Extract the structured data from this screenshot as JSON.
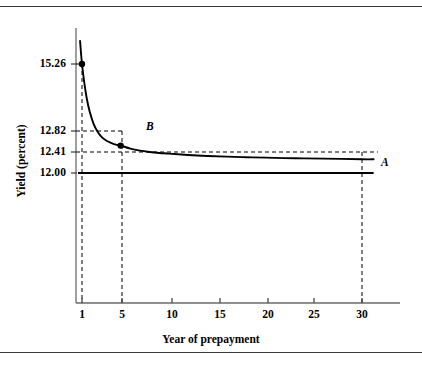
{
  "chart_data": {
    "type": "line",
    "title": "",
    "xlabel": "Year of prepayment",
    "ylabel": "Yield (percent)",
    "xlim": [
      0,
      31.5
    ],
    "ylim": [
      12.0,
      15.95
    ],
    "grid": false,
    "legend": "none",
    "x_ticks": [
      1,
      5,
      10,
      15,
      20,
      25,
      30
    ],
    "x_tick_labels": [
      "1",
      "5",
      "10",
      "15",
      "20",
      "25",
      "30"
    ],
    "y_ticks": [
      12.0,
      12.41,
      12.82,
      15.26
    ],
    "y_tick_labels": [
      "12.00",
      "12.41",
      "12.82",
      "15.26"
    ],
    "series": [
      {
        "name": "Yield to prepayment (curve)",
        "type": "line",
        "style": "solid",
        "x": [
          0.8,
          0.9,
          1.0,
          1.2,
          1.5,
          1.8,
          2.2,
          2.6,
          3.0,
          3.5,
          4.0,
          4.5,
          5.0,
          6.0,
          7.0,
          8.0,
          9.0,
          10.0,
          12.0,
          14.0,
          16.0,
          18.0,
          20.0,
          23.0,
          26.0,
          30.0,
          31.2
        ],
        "y": [
          15.95,
          15.58,
          15.26,
          14.78,
          14.22,
          13.83,
          13.47,
          13.24,
          13.09,
          12.97,
          12.9,
          12.85,
          12.82,
          12.73,
          12.67,
          12.63,
          12.6,
          12.58,
          12.54,
          12.51,
          12.49,
          12.47,
          12.46,
          12.44,
          12.43,
          12.41,
          12.41
        ]
      },
      {
        "name": "Yield to maturity (line A)",
        "type": "line",
        "style": "solid",
        "x": [
          1.0,
          31.2
        ],
        "y": [
          12.0,
          12.0
        ]
      },
      {
        "name": "Asymptote 12.41 (dashed)",
        "type": "line",
        "style": "dashed",
        "x": [
          1.0,
          31.2
        ],
        "y": [
          12.41,
          12.41
        ]
      }
    ],
    "points": [
      {
        "label": "",
        "x": 1,
        "y": 15.26
      },
      {
        "label": "B",
        "x": 5,
        "y": 12.82
      }
    ],
    "annotations": [
      {
        "label": "B",
        "x": 7.0,
        "y": 12.94
      },
      {
        "label": "A",
        "x": 31.0,
        "y": 11.92
      }
    ],
    "guides": [
      {
        "orientation": "horizontal",
        "value": 15.26,
        "style": "dashed",
        "from_x": 0,
        "to_x": 1
      },
      {
        "orientation": "horizontal",
        "value": 12.82,
        "style": "dashed",
        "from_x": 0,
        "to_x": 5
      },
      {
        "orientation": "horizontal",
        "value": 12.41,
        "style": "dashed",
        "from_x": 0,
        "to_x": 30
      },
      {
        "orientation": "vertical",
        "value": 1,
        "style": "dashed"
      },
      {
        "orientation": "vertical",
        "value": 5,
        "style": "dashed"
      },
      {
        "orientation": "vertical",
        "value": 30,
        "style": "dashed"
      }
    ],
    "colors": {
      "curve": "#000000",
      "guide": "#000000",
      "axis": "#555555",
      "frame_rule": "#3a3a3a",
      "background": "#ffffff"
    }
  },
  "axes": {
    "y_title": "Yield (percent)",
    "x_title": "Year of prepayment",
    "y_tick_labels": [
      "15.26",
      "12.82",
      "12.41",
      "12.00"
    ],
    "x_tick_labels": [
      "1",
      "5",
      "10",
      "15",
      "20",
      "25",
      "30"
    ]
  },
  "markers": {
    "label_a": "A",
    "label_b": "B"
  }
}
